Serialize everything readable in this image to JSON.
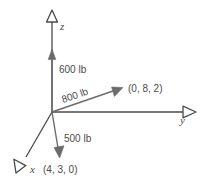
{
  "figure": {
    "background_color": "#ffffff",
    "stroke_color": "#4a4a4a",
    "text_color": "#4a4a4a"
  },
  "axes": [
    {
      "name": "z-axis",
      "label": "z",
      "direction": "up",
      "arrowhead": "open-triangle"
    },
    {
      "name": "y-axis",
      "label": "y",
      "direction": "right",
      "arrowhead": "open-triangle"
    },
    {
      "name": "x-axis",
      "label": "x",
      "direction": "down-left",
      "arrowhead": "open-triangle"
    }
  ],
  "forces": [
    {
      "name": "force-600",
      "label": "600 lb",
      "direction": "up",
      "arrowhead": "solid"
    },
    {
      "name": "force-800",
      "label": "800 lb",
      "direction": "up-right",
      "arrowhead": "solid",
      "rotated": true
    },
    {
      "name": "force-500",
      "label": "500 lb",
      "direction": "down",
      "arrowhead": "solid"
    }
  ],
  "points": [
    {
      "name": "point-082",
      "label": "(0, 8, 2)"
    },
    {
      "name": "point-430",
      "label": "(4, 3, 0)"
    }
  ]
}
